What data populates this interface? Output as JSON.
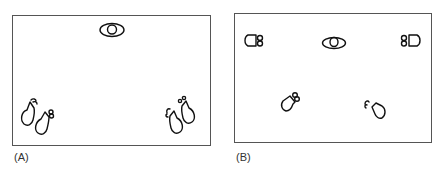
{
  "panels": [
    {
      "id": "A",
      "label": "(A)",
      "description": "Eye/camera at top center; two pairs of footprints in bottom-left and bottom-right corners",
      "elements": [
        "eye",
        "footprints-bottom-left",
        "footprints-bottom-right"
      ]
    },
    {
      "id": "B",
      "label": "(B)",
      "description": "Eye/camera at center-top; four figures arranged around it (left, right, bottom-left, bottom-right)",
      "elements": [
        "eye",
        "figure-left",
        "figure-right",
        "figure-bottom-left",
        "figure-bottom-right"
      ]
    }
  ],
  "colors": {
    "stroke": "#111111",
    "border": "#555555",
    "background": "#ffffff"
  }
}
